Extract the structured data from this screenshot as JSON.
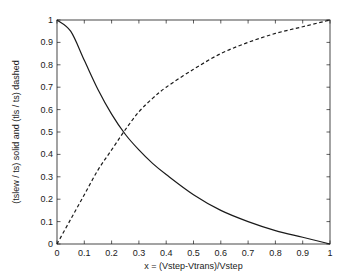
{
  "chart_data": {
    "type": "line",
    "title": "",
    "xlabel": "x = (Vstep-Vtrans)/Vstep",
    "ylabel": "(tslew / ts) solid and (tls / ts) dashed",
    "xlim": [
      0,
      1
    ],
    "ylim": [
      0,
      1
    ],
    "grid": false,
    "box": true,
    "legend": null,
    "x_ticks": [
      0,
      0.1,
      0.2,
      0.3,
      0.4,
      0.5,
      0.6,
      0.7,
      0.8,
      0.9,
      1
    ],
    "x_tick_labels": [
      "0",
      "0.1",
      "0.2",
      "0.3",
      "0.4",
      "0.5",
      "0.6",
      "0.7",
      "0.8",
      "0.9",
      "1"
    ],
    "y_ticks": [
      0,
      0.1,
      0.2,
      0.3,
      0.4,
      0.5,
      0.6,
      0.7,
      0.8,
      0.9,
      1
    ],
    "y_tick_labels": [
      "0",
      "0.1",
      "0.2",
      "0.3",
      "0.4",
      "0.5",
      "0.6",
      "0.7",
      "0.8",
      "0.9",
      "1"
    ],
    "x": [
      0,
      0.05,
      0.1,
      0.15,
      0.2,
      0.25,
      0.3,
      0.35,
      0.4,
      0.5,
      0.6,
      0.7,
      0.8,
      0.9,
      1.0
    ],
    "series": [
      {
        "name": "tslew / ts",
        "style": "solid",
        "color": "#1a1a1a",
        "values": [
          1.0,
          0.95,
          0.82,
          0.69,
          0.58,
          0.49,
          0.42,
          0.36,
          0.31,
          0.22,
          0.15,
          0.1,
          0.06,
          0.03,
          0.0
        ]
      },
      {
        "name": "tls / ts",
        "style": "dashed",
        "color": "#1a1a1a",
        "values": [
          0.0,
          0.11,
          0.22,
          0.33,
          0.42,
          0.51,
          0.59,
          0.65,
          0.7,
          0.78,
          0.85,
          0.9,
          0.94,
          0.97,
          1.0
        ]
      }
    ]
  },
  "layout": {
    "plot_left": 57,
    "plot_right": 330,
    "plot_top": 20,
    "plot_bottom": 244
  }
}
